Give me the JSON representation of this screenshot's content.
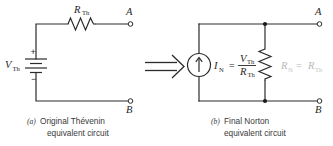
{
  "figure": {
    "transform_arrow": "double-right-arrow"
  },
  "colors": {
    "wire": "#2b2b2b",
    "label": "#262626",
    "faded_label": "#b8b8b8",
    "caption": "#3a3a3a",
    "background": "#ffffff"
  },
  "panel_a": {
    "caption_tag": "(a)",
    "caption_line1": "Original Thévenin",
    "caption_line2": "equivalent circuit",
    "source": {
      "type": "battery",
      "label_main": "V",
      "label_sub": "Th",
      "plus": "+",
      "minus": "−"
    },
    "resistor": {
      "type": "zigzag-resistor",
      "label_main": "R",
      "label_sub": "Th"
    },
    "terminals": [
      {
        "name": "A",
        "label": "A"
      },
      {
        "name": "B",
        "label": "B"
      }
    ]
  },
  "panel_b": {
    "caption_tag": "(b)",
    "caption_line1": "Final Norton",
    "caption_line2": "equivalent circuit",
    "current_source": {
      "type": "current-source",
      "label_main": "I",
      "label_sub": "N",
      "equals": "=",
      "numerator_main": "V",
      "numerator_sub": "Th",
      "denominator_main": "R",
      "denominator_sub": "Th"
    },
    "resistor": {
      "type": "zigzag-resistor-vertical",
      "label_main": "R",
      "label_sub": "N",
      "equals": "=",
      "label_main2": "R",
      "label_sub2": "Th",
      "faded": true
    },
    "terminals": [
      {
        "name": "A",
        "label": "A"
      },
      {
        "name": "B",
        "label": "B"
      }
    ]
  }
}
